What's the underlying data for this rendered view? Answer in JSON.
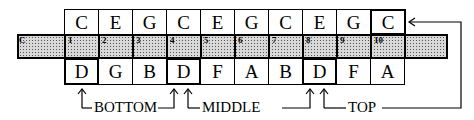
{
  "top_row": {
    "notes": [
      "C",
      "E",
      "G",
      "C",
      "E",
      "G",
      "C",
      "E",
      "G",
      "C"
    ],
    "bold_indices": [
      9
    ]
  },
  "strip": {
    "first_label": "C",
    "numbers": [
      "1",
      "2",
      "3",
      "4",
      "5",
      "6",
      "7",
      "8",
      "9",
      "10"
    ]
  },
  "bottom_row": {
    "notes": [
      "D",
      "G",
      "B",
      "D",
      "F",
      "A",
      "B",
      "D",
      "F",
      "A"
    ],
    "bold_indices": [
      0,
      3,
      7
    ]
  },
  "labels": {
    "bottom": "BOTTOM",
    "middle": "MIDDLE",
    "top": "TOP"
  }
}
